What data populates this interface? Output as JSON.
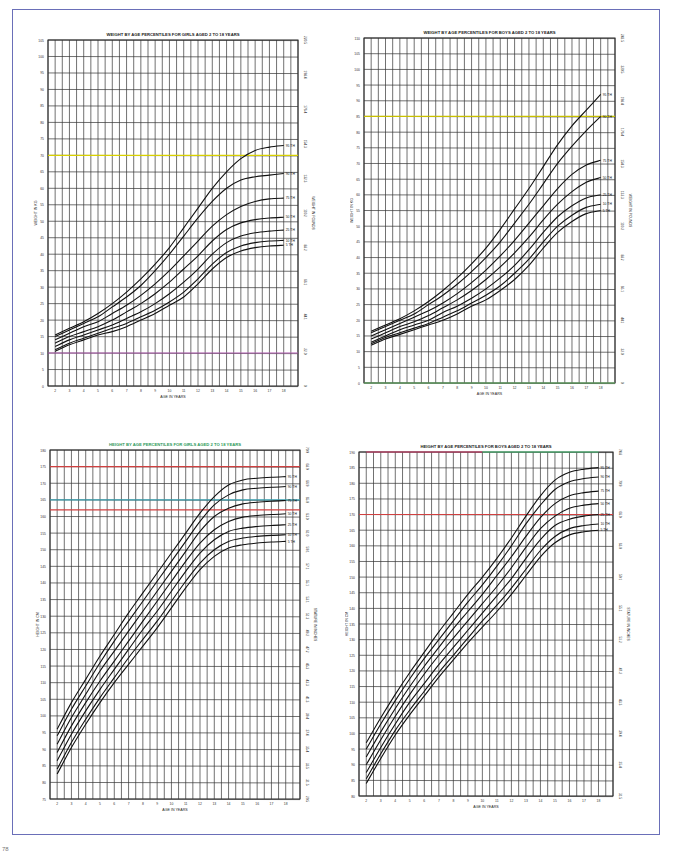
{
  "page": {
    "footer_mark": "78"
  },
  "chart_data": [
    {
      "id": "girls-weight",
      "type": "line",
      "title": "WEIGHT BY AGE PERCENTILES FOR GIRLS AGED 2 TO 18 YEARS",
      "title_color": "#222222",
      "xlabel": "AGE IN YEARS",
      "ylabel": "WEIGHT IN KG",
      "ylabel_right": "WEIGHT IN POUNDS",
      "x": [
        2,
        3,
        4,
        5,
        6,
        7,
        8,
        9,
        10,
        11,
        12,
        13,
        14,
        15,
        16,
        17,
        18
      ],
      "xlim": [
        2,
        18
      ],
      "ylim": [
        0,
        105
      ],
      "ytick_step": 5,
      "yticks_right": [
        "0",
        "22.0",
        "44.1",
        "66.1",
        "88.2",
        "110.2",
        "132.3",
        "154.3",
        "176.4",
        "198.4",
        "220.5"
      ],
      "grid": true,
      "highlight_lines": [
        {
          "y": 70,
          "color": "#d8d000"
        },
        {
          "y": 10,
          "color": "#b05ab0"
        }
      ],
      "series": [
        {
          "name": "95 TH",
          "values": [
            15.5,
            17.5,
            19.5,
            22,
            25,
            28.5,
            32.5,
            37,
            42,
            48,
            54,
            60,
            65,
            69,
            71.5,
            72.5,
            73
          ]
        },
        {
          "name": "90 TH",
          "values": [
            15,
            17,
            19,
            21,
            24,
            27,
            30.5,
            35,
            40,
            45.5,
            51,
            56,
            60,
            62.5,
            63.5,
            64,
            64.5
          ]
        },
        {
          "name": "75 TH",
          "values": [
            14,
            16,
            18,
            19.5,
            22,
            24.5,
            27.5,
            31,
            35,
            39.5,
            44,
            48.5,
            52,
            54.5,
            56,
            56.8,
            57
          ]
        },
        {
          "name": "50 TH",
          "values": [
            13,
            15,
            16.5,
            18,
            20,
            22.5,
            25,
            28,
            31.5,
            35.5,
            39.5,
            44,
            47.5,
            49.5,
            50.5,
            51,
            51.2
          ]
        },
        {
          "name": "25 TH",
          "values": [
            12,
            14,
            15.5,
            17,
            18.5,
            20.5,
            22.5,
            25,
            28,
            31.5,
            35.5,
            40,
            43.5,
            45.5,
            46.5,
            47,
            47.3
          ]
        },
        {
          "name": "10 TH",
          "values": [
            11,
            13,
            14.5,
            16,
            17.5,
            19,
            21,
            23,
            25.5,
            28.5,
            32.5,
            37,
            40.5,
            42.5,
            43.5,
            44,
            44.2
          ]
        },
        {
          "name": "5 TH",
          "values": [
            10.5,
            12.5,
            14,
            15.5,
            16.5,
            18,
            20,
            22,
            24.5,
            27,
            31,
            35.5,
            39,
            41,
            42,
            42.5,
            42.7
          ]
        }
      ]
    },
    {
      "id": "boys-weight",
      "type": "line",
      "title": "WEIGHT BY AGE PERCENTILES FOR BOYS AGED 2 TO 18 YEARS",
      "title_color": "#222222",
      "xlabel": "AGE IN YEARS",
      "ylabel": "WEIGHT IN KG",
      "ylabel_right": "WEIGHT IN POUNDS",
      "x": [
        2,
        3,
        4,
        5,
        6,
        7,
        8,
        9,
        10,
        11,
        12,
        13,
        14,
        15,
        16,
        17,
        18
      ],
      "xlim": [
        2,
        18
      ],
      "ylim": [
        0,
        110
      ],
      "ytick_step": 5,
      "yticks_right": [
        "0",
        "22.0",
        "44.1",
        "66.1",
        "88.2",
        "110.2",
        "132.3",
        "154.3",
        "176.4",
        "198.4",
        "220.5",
        "242.5"
      ],
      "grid": true,
      "highlight_lines": [
        {
          "y": 85,
          "color": "#c8c000"
        },
        {
          "y": 0,
          "color": "#66bb66"
        }
      ],
      "series": [
        {
          "name": "95 TH",
          "values": [
            16.5,
            18.5,
            20.5,
            23,
            26,
            29.5,
            33.5,
            38,
            43,
            49,
            55.5,
            62,
            69,
            76,
            82,
            87,
            92
          ]
        },
        {
          "name": "90 TH",
          "values": [
            16,
            18,
            20,
            22,
            25,
            28,
            31.5,
            35.5,
            40,
            45,
            51,
            57,
            63.5,
            70,
            75.5,
            80.5,
            85
          ]
        },
        {
          "name": "75 TH",
          "values": [
            15,
            17,
            19,
            21,
            23,
            25.5,
            28.5,
            32,
            36,
            40.5,
            45.5,
            51,
            56.5,
            62,
            66.5,
            69.5,
            71
          ]
        },
        {
          "name": "50 TH",
          "values": [
            14,
            16,
            18,
            19.5,
            21.5,
            24,
            26.5,
            29.5,
            33,
            37,
            41.5,
            46.5,
            52,
            57,
            61,
            64,
            65.5
          ]
        },
        {
          "name": "25 TH",
          "values": [
            13,
            15,
            17,
            18.5,
            20,
            22.5,
            24.5,
            27,
            30,
            33.5,
            37.5,
            42.5,
            48,
            53,
            56.5,
            59,
            60
          ]
        },
        {
          "name": "10 TH",
          "values": [
            12.5,
            14.5,
            16,
            17.5,
            19,
            21,
            23,
            25.5,
            28,
            31,
            35,
            39.5,
            45,
            50,
            53.5,
            56,
            57
          ]
        },
        {
          "name": "5 TH",
          "values": [
            12,
            14,
            15.5,
            17,
            18.5,
            20,
            22,
            24.5,
            26.5,
            29.5,
            33,
            37.5,
            43,
            48,
            51.5,
            54,
            55
          ]
        }
      ]
    },
    {
      "id": "girls-height",
      "type": "line",
      "title": "HEIGHT BY AGE PERCENTILES FOR GIRLS AGED 2 TO 18 YEARS",
      "title_color": "#2e9a5a",
      "xlabel": "AGE IN YEARS",
      "ylabel": "HEIGHT IN CM",
      "ylabel_right": "STATURE IN INCHES",
      "x": [
        2,
        3,
        4,
        5,
        6,
        7,
        8,
        9,
        10,
        11,
        12,
        13,
        14,
        15,
        16,
        17,
        18
      ],
      "xlim": [
        2,
        18
      ],
      "ylim": [
        75,
        180
      ],
      "ytick_step": 5,
      "yticks_right": [
        "29.5",
        "31.5",
        "33.5",
        "35.4",
        "37.4",
        "39.4",
        "41.3",
        "43.3",
        "45.3",
        "47.2",
        "49.2",
        "51.2",
        "53.1",
        "55.1",
        "57.1",
        "59.1",
        "61.0",
        "63.0",
        "65.0",
        "66.9",
        "68.9",
        "70.9"
      ],
      "grid": true,
      "highlight_lines": [
        {
          "y": 175,
          "color": "#d04040"
        },
        {
          "y": 165,
          "color": "#3aa0b0"
        },
        {
          "y": 162,
          "color": "#d04040"
        }
      ],
      "series": [
        {
          "name": "95 TH",
          "values": [
            96,
            104,
            111,
            118,
            124.5,
            131,
            137,
            143,
            149,
            155,
            161,
            166,
            169.5,
            171,
            171.5,
            171.8,
            172
          ]
        },
        {
          "name": "90 TH",
          "values": [
            94,
            102,
            109,
            116,
            122.5,
            128.5,
            134.5,
            140.5,
            146.5,
            152.5,
            158.5,
            163.5,
            166.5,
            168,
            168.5,
            168.8,
            169
          ]
        },
        {
          "name": "75 TH",
          "values": [
            91.5,
            99.5,
            106.5,
            113.5,
            119.5,
            125.5,
            131.5,
            137.5,
            143.5,
            149.5,
            155.5,
            160,
            162.5,
            163.8,
            164.3,
            164.6,
            164.8
          ]
        },
        {
          "name": "50 TH",
          "values": [
            89,
            97,
            104,
            110.5,
            116.5,
            122.5,
            128.5,
            134.5,
            140.5,
            146.5,
            152,
            156,
            158.5,
            159.8,
            160.3,
            160.6,
            160.8
          ]
        },
        {
          "name": "25 TH",
          "values": [
            86.5,
            94.5,
            101.5,
            108,
            114,
            120,
            126,
            131.5,
            137.5,
            143.5,
            149,
            153,
            155.5,
            156.5,
            157,
            157.3,
            157.5
          ]
        },
        {
          "name": "10 TH",
          "values": [
            84,
            92,
            99,
            105.5,
            111.5,
            117.5,
            123,
            128.5,
            134.5,
            140.5,
            146,
            150,
            152.5,
            153.5,
            154,
            154.3,
            154.5
          ]
        },
        {
          "name": "5 TH",
          "values": [
            82.5,
            90.5,
            97.5,
            104,
            110,
            115.5,
            121,
            126.5,
            132.5,
            138.5,
            144,
            148,
            150.5,
            151.5,
            152,
            152.3,
            152.5
          ]
        }
      ]
    },
    {
      "id": "boys-height",
      "type": "line",
      "title": "HEIGHT BY AGE PERCENTILES FOR BOYS AGED 2 TO 18 YEARS",
      "title_color": "#222222",
      "xlabel": "AGE IN YEARS",
      "ylabel": "HEIGHT IN CM",
      "ylabel_right": "STATURE IN INCHES",
      "x": [
        2,
        3,
        4,
        5,
        6,
        7,
        8,
        9,
        10,
        11,
        12,
        13,
        14,
        15,
        16,
        17,
        18
      ],
      "xlim": [
        2,
        18
      ],
      "ylim": [
        80,
        190
      ],
      "ytick_step": 5,
      "yticks_right": [
        "31.5",
        "35.4",
        "39.4",
        "43.3",
        "47.2",
        "51.2",
        "55.1",
        "59.1",
        "63.0",
        "66.9",
        "70.9",
        "74.8"
      ],
      "grid": true,
      "highlight_lines": [
        {
          "y": 190,
          "color": "#e04070",
          "segment": [
            2,
            10
          ]
        },
        {
          "y": 190,
          "color": "#50d080",
          "segment": [
            10,
            18
          ]
        },
        {
          "y": 170,
          "color": "#d04040"
        }
      ],
      "series": [
        {
          "name": "95 TH",
          "values": [
            97,
            105,
            112.5,
            119.5,
            126,
            132.5,
            138.5,
            144.5,
            150,
            156,
            162.5,
            169.5,
            176,
            181,
            183.5,
            184.5,
            185
          ]
        },
        {
          "name": "90 TH",
          "values": [
            95,
            103,
            110.5,
            117.5,
            124,
            130,
            136,
            142,
            147.5,
            153.5,
            160,
            167,
            173,
            178,
            180.5,
            181.5,
            182
          ]
        },
        {
          "name": "75 TH",
          "values": [
            92.5,
            100.5,
            108,
            115,
            121.5,
            127.5,
            133.5,
            139,
            144.5,
            150.5,
            156.5,
            163,
            169,
            173.5,
            176,
            177,
            177.5
          ]
        },
        {
          "name": "50 TH",
          "values": [
            90,
            98,
            105.5,
            112.5,
            119,
            125,
            130.5,
            136,
            141.5,
            147,
            153,
            159.5,
            165.5,
            169.5,
            172,
            173,
            173.5
          ]
        },
        {
          "name": "25 TH",
          "values": [
            87.5,
            95.5,
            103,
            110,
            116,
            122,
            127.5,
            133,
            138.5,
            144,
            149.5,
            156,
            162,
            166.5,
            168.5,
            169.5,
            170
          ]
        },
        {
          "name": "10 TH",
          "values": [
            85.5,
            93.5,
            101,
            107.5,
            113.5,
            119.5,
            125,
            130.5,
            136,
            141,
            146.5,
            152.5,
            158.5,
            163,
            165.5,
            166.5,
            167
          ]
        },
        {
          "name": "5 TH",
          "values": [
            84,
            92,
            99.5,
            106,
            112,
            118,
            123.5,
            129,
            134,
            139,
            144.5,
            150.5,
            156.5,
            161,
            163.5,
            164.5,
            165
          ]
        }
      ]
    }
  ]
}
